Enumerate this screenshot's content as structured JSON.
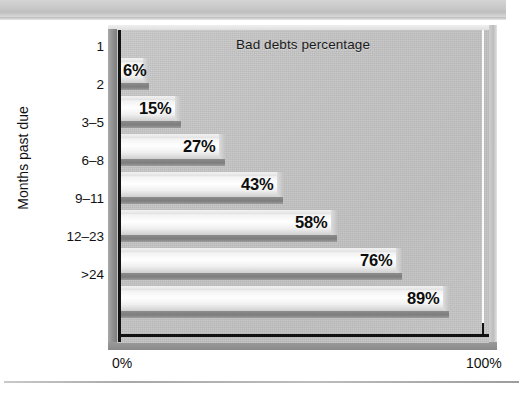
{
  "page": {
    "top_band": "scan-header-band",
    "bottom_rule": "scan-footer-rule"
  },
  "chart_data": {
    "type": "bar",
    "orientation": "horizontal",
    "title": "Bad debts percentage",
    "xlabel": "",
    "ylabel": "Months past due",
    "categories": [
      "1",
      "2",
      "3–5",
      "6–8",
      "9–11",
      "12–23",
      ">24"
    ],
    "values": [
      6,
      15,
      27,
      43,
      58,
      76,
      89
    ],
    "value_labels": [
      "6%",
      "15%",
      "27%",
      "43%",
      "58%",
      "76%",
      "89%"
    ],
    "xlim": [
      0,
      100
    ],
    "x_tick_labels": [
      "0%",
      "100%"
    ],
    "x_ticks": [
      0,
      100
    ],
    "grid": false,
    "gridline_at": 100,
    "legend": null,
    "style": {
      "plot_background": "#c3c3c3",
      "frame_background": "#bdbdbd",
      "bar_fill_light": "#ffffff",
      "bar_fill_dark": "#cfcfcf",
      "bar_shadow": "#8c8c8c",
      "axis_color": "#121212",
      "text_color": "#111111",
      "gridline_color": "#fbfbfb",
      "page_band": "#c9c9c9"
    }
  }
}
